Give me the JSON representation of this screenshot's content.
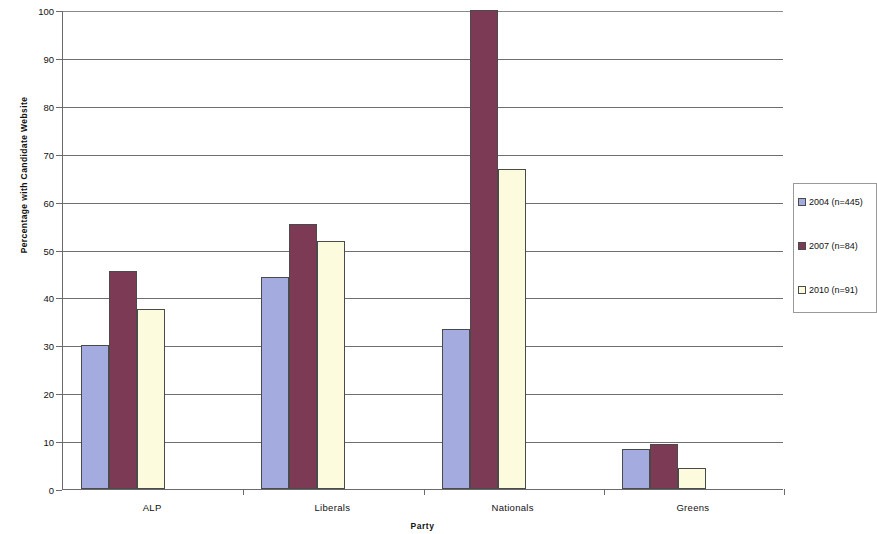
{
  "chart_data": {
    "type": "bar",
    "title": "",
    "xlabel": "Party",
    "ylabel": "Percentage with Candidate Website",
    "categories": [
      "ALP",
      "Liberals",
      "Nationals",
      "Greens"
    ],
    "series": [
      {
        "name": "2004 (n=445)",
        "color": "#A3ABDF",
        "values": [
          30.0,
          44.3,
          33.5,
          8.3
        ]
      },
      {
        "name": "2007 (n=84)",
        "color": "#7D3A55",
        "values": [
          45.5,
          55.3,
          100.0,
          9.4
        ]
      },
      {
        "name": "2010 (n=91)",
        "color": "#FCFBDD",
        "values": [
          37.5,
          51.7,
          66.8,
          4.3
        ]
      }
    ],
    "ylim": [
      0,
      100
    ],
    "yticks": [
      0,
      10,
      20,
      30,
      40,
      50,
      60,
      70,
      80,
      90,
      100
    ],
    "ytick_labels": [
      "0",
      "10",
      "20",
      "30",
      "40",
      "50",
      "60",
      "70",
      "80",
      "90",
      "100"
    ],
    "grid": "horizontal",
    "legend_position": "right",
    "bar_border_color": "#4A4A4A",
    "axis_color": "#6B6B6B",
    "gridline_color": "#6F6F6F",
    "background_color": "#FFFFFF"
  }
}
